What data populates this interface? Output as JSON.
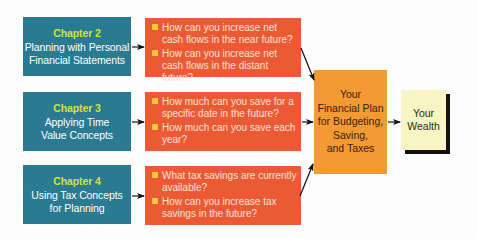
{
  "colors": {
    "chapter_bg": "#2a7a92",
    "chapter_title": "#d7e03a",
    "question_bg": "#ec5a35",
    "bullet": "#f7c53c",
    "plan_bg": "#f49a32",
    "wealth_bg": "#f8f4c4"
  },
  "chapters": [
    {
      "title": "Chapter 2",
      "lines": [
        "Planning with Personal",
        "Financial Statements"
      ],
      "questions": [
        "How can you increase net cash flows in the near future?",
        "How can you increase net cash flows in the distant future?"
      ]
    },
    {
      "title": "Chapter 3",
      "lines": [
        "Applying Time",
        "Value Concepts"
      ],
      "questions": [
        "How much can you save for a specific date in the future?",
        "How much can you save each year?"
      ]
    },
    {
      "title": "Chapter 4",
      "lines": [
        "Using Tax Concepts",
        "for Planning"
      ],
      "questions": [
        "What tax savings are currently available?",
        "How can you increase tax savings in the future?"
      ]
    }
  ],
  "plan": {
    "lines": [
      "Your",
      "Financial Plan",
      "for Budgeting,",
      "Saving,",
      "and Taxes"
    ]
  },
  "wealth": {
    "lines": [
      "Your",
      "Wealth"
    ]
  }
}
